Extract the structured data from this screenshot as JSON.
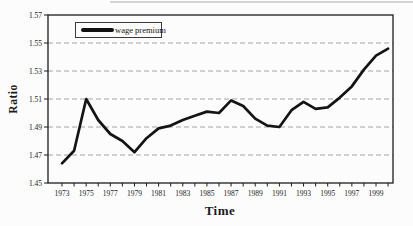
{
  "figure": {
    "background": "#fcfcfc",
    "artifact_note": "faint scanner line at top edge"
  },
  "chart_data": {
    "type": "line",
    "title": "",
    "xlabel": "Time",
    "ylabel": "Ratio",
    "x": [
      1973,
      1974,
      1975,
      1976,
      1977,
      1978,
      1979,
      1980,
      1981,
      1982,
      1983,
      1984,
      1985,
      1986,
      1987,
      1988,
      1989,
      1990,
      1991,
      1992,
      1993,
      1994,
      1995,
      1996,
      1997,
      1998,
      1999,
      2000
    ],
    "series": [
      {
        "name": "wage premium",
        "color": "#141414",
        "values": [
          1.464,
          1.473,
          1.51,
          1.495,
          1.485,
          1.48,
          1.472,
          1.482,
          1.489,
          1.491,
          1.495,
          1.498,
          1.501,
          1.5,
          1.509,
          1.505,
          1.496,
          1.491,
          1.49,
          1.502,
          1.508,
          1.503,
          1.504,
          1.511,
          1.519,
          1.531,
          1.541,
          1.546
        ]
      }
    ],
    "ylim": [
      1.45,
      1.57
    ],
    "yticks": [
      1.45,
      1.47,
      1.49,
      1.51,
      1.53,
      1.55,
      1.57
    ],
    "xticks": [
      1973,
      1975,
      1977,
      1979,
      1981,
      1983,
      1985,
      1987,
      1989,
      1991,
      1993,
      1995,
      1997,
      1999
    ],
    "grid": {
      "horizontal": true,
      "style": "dashed",
      "color": "#9b9b9b"
    },
    "legend": {
      "position": "top-left",
      "entries": [
        "wage premium"
      ]
    },
    "axis_color": "#1c1c1c",
    "tick_label_color": "#222222"
  }
}
